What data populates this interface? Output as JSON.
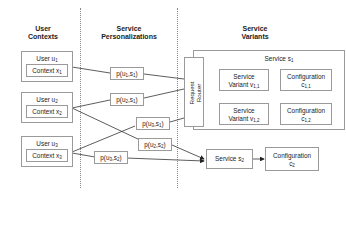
{
  "headers": {
    "user_contexts": [
      "User",
      "Contexts"
    ],
    "service_personalizations": [
      "Service",
      "Personalizations"
    ],
    "service_variants": [
      "Service",
      "Variants"
    ]
  },
  "users": [
    {
      "user": "User u",
      "user_sub": "1",
      "context": "Context x",
      "context_sub": "1"
    },
    {
      "user": "User u",
      "user_sub": "2",
      "context": "Context x",
      "context_sub": "2"
    },
    {
      "user": "User u",
      "user_sub": "3",
      "context": "Context x",
      "context_sub": "3"
    }
  ],
  "personalizations": [
    {
      "label": "p(u",
      "a": "1",
      "b": "1"
    },
    {
      "label": "p(u",
      "a": "2",
      "b": "1"
    },
    {
      "label": "p(u",
      "a": "3",
      "b": "1"
    },
    {
      "label": "p(u",
      "a": "2",
      "b": "2"
    },
    {
      "label": "p(u",
      "a": "3",
      "b": "2"
    }
  ],
  "router": {
    "line1": "Request",
    "line2": "Router"
  },
  "service1": {
    "title": "Service s",
    "title_sub": "1",
    "variants": [
      {
        "line1": "Service",
        "line2": "Variant v",
        "sub": "1,1",
        "config_line1": "Configuration",
        "config_line2": "c",
        "config_sub": "1,1"
      },
      {
        "line1": "Service",
        "line2": "Variant v",
        "sub": "1,2",
        "config_line1": "Configuration",
        "config_line2": "c",
        "config_sub": "1,2"
      }
    ]
  },
  "service2": {
    "title": "Service s",
    "title_sub": "2",
    "config_line1": "Configuration",
    "config_line2": "c",
    "config_sub": "2"
  },
  "colors": {
    "border": "#9a9a9a",
    "line": "#333333",
    "text": "#222222"
  }
}
